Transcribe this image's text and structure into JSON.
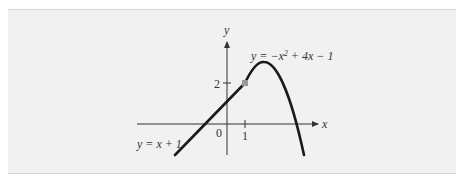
{
  "figure": {
    "axis_labels": {
      "x": "x",
      "y": "y"
    },
    "ticks": {
      "origin": "0",
      "x_one": "1",
      "y_two": "2"
    },
    "curves": [
      {
        "label": "y = x + 1",
        "type": "line",
        "domain": "x ≤ 1"
      },
      {
        "label": "y = −x² + 4x − 1",
        "type": "parabola",
        "domain": "x > 1"
      }
    ],
    "junction_point": {
      "x": 1,
      "y": 2
    },
    "colors": {
      "curve": "#1a1a1a",
      "axis": "#333333",
      "point": "#9a9a9a",
      "background": "#f1f1f1"
    }
  },
  "labels": {
    "line_label": "y = x + 1",
    "parabola_label_prefix": "y = −x",
    "parabola_label_exp": "2",
    "parabola_label_suffix": " + 4x − 1"
  }
}
